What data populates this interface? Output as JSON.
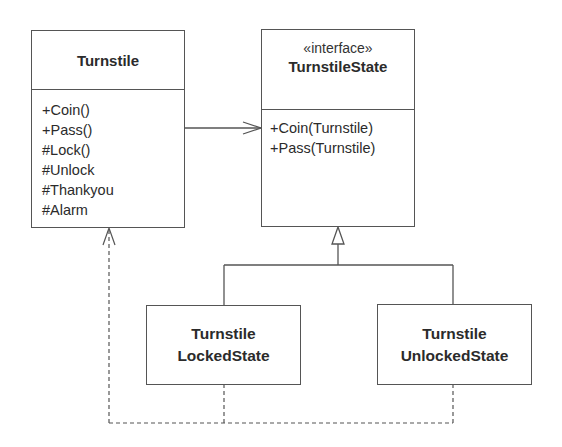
{
  "diagram": {
    "type": "UML class diagram",
    "colors": {
      "line": "#555555",
      "text": "#2b2b2b",
      "background": "#ffffff"
    },
    "classes": {
      "turnstile": {
        "name": "Turnstile",
        "operations": [
          "+Coin()",
          "+Pass()",
          "#Lock()",
          "#Unlock",
          "#Thankyou",
          "#Alarm"
        ]
      },
      "turnstile_state": {
        "stereotype": "«interface»",
        "name": "TurnstileState",
        "operations": [
          "+Coin(Turnstile)",
          "+Pass(Turnstile)"
        ]
      },
      "locked_state": {
        "name_line1": "Turnstile",
        "name_line2": "LockedState"
      },
      "unlocked_state": {
        "name_line1": "Turnstile",
        "name_line2": "UnlockedState"
      }
    },
    "relationships": [
      {
        "from": "Turnstile",
        "to": "TurnstileState",
        "kind": "association",
        "style": "solid-open-arrow"
      },
      {
        "from": "TurnstileLockedState",
        "to": "TurnstileState",
        "kind": "realization",
        "style": "hollow-triangle"
      },
      {
        "from": "TurnstileUnlockedState",
        "to": "TurnstileState",
        "kind": "realization",
        "style": "hollow-triangle"
      },
      {
        "from": "TurnstileLockedState",
        "to": "Turnstile",
        "kind": "dependency",
        "style": "dashed-open-arrow"
      },
      {
        "from": "TurnstileUnlockedState",
        "to": "Turnstile",
        "kind": "dependency",
        "style": "dashed-open-arrow"
      }
    ]
  }
}
